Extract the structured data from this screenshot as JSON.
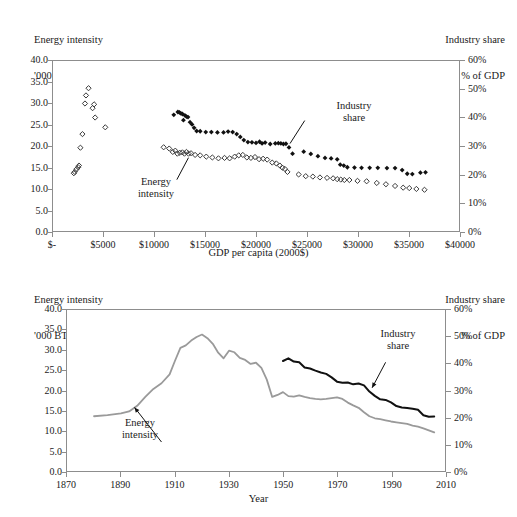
{
  "figure": {
    "panels": [
      {
        "id": "scatter-gdp",
        "left_axis_title_line1": "Energy intensity",
        "left_axis_title_line2": "'000 BTU/2000$",
        "right_axis_title_line1": "Industry share",
        "right_axis_title_line2": "% of GDP",
        "xlabel": "GDP per capita (2000$)",
        "yticks_left": [
          "40.0",
          "35.0",
          "30.0",
          "25.0",
          "20.0",
          "15.0",
          "10.0",
          "5.0",
          "0.0"
        ],
        "yticks_right": [
          "60%",
          "50%",
          "40%",
          "30%",
          "20%",
          "10%",
          "0%"
        ],
        "xticks": [
          "$-",
          "$5000",
          "$10000",
          "$15000",
          "$20000",
          "$25000",
          "$30000",
          "$35000",
          "$40000"
        ],
        "annotation_energy": "Energy\nintensity",
        "annotation_industry": "Industry\nshare"
      },
      {
        "id": "timeseries-year",
        "left_axis_title_line1": "Energy intensity",
        "left_axis_title_line2": "'000 BTU/2000$",
        "right_axis_title_line1": "Industry share",
        "right_axis_title_line2": "% of GDP",
        "xlabel": "Year",
        "yticks_left": [
          "40.0",
          "35.0",
          "30.0",
          "25.0",
          "20.0",
          "15.0",
          "10.0",
          "5.0",
          "0.0"
        ],
        "yticks_right": [
          "60%",
          "50%",
          "40%",
          "30%",
          "20%",
          "10%",
          "0%"
        ],
        "xticks": [
          "1870",
          "1890",
          "1910",
          "1930",
          "1950",
          "1970",
          "1990",
          "2010"
        ],
        "annotation_energy": "Energy\nintensity",
        "annotation_industry": "Industry\nshare"
      }
    ]
  },
  "chart_data": [
    {
      "type": "scatter",
      "id": "scatter-gdp",
      "title": "",
      "xlabel": "GDP per capita (2000$)",
      "ylabel": "Energy intensity '000 BTU/2000$",
      "y2label": "Industry share % of GDP",
      "xlim": [
        0,
        40000
      ],
      "ylim": [
        0.0,
        40.0
      ],
      "y2lim": [
        0,
        60
      ],
      "grid": false,
      "legend": "annotations",
      "xticks": [
        0,
        5000,
        10000,
        15000,
        20000,
        25000,
        30000,
        35000,
        40000
      ],
      "xticklabels": [
        "$-",
        "$5000",
        "$10000",
        "$15000",
        "$20000",
        "$25000",
        "$30000",
        "$35000",
        "$40000"
      ],
      "yticks": [
        0.0,
        5.0,
        10.0,
        15.0,
        20.0,
        25.0,
        30.0,
        35.0,
        40.0
      ],
      "y2ticks": [
        0,
        10,
        20,
        30,
        40,
        50,
        60
      ],
      "series": [
        {
          "name": "Energy intensity",
          "marker": "open-diamond",
          "color": "#3a3a3a",
          "axis": "left",
          "points": [
            [
              2050,
              13.6
            ],
            [
              2150,
              13.9
            ],
            [
              2300,
              14.5
            ],
            [
              2480,
              15.0
            ],
            [
              2560,
              15.4
            ],
            [
              2700,
              19.6
            ],
            [
              2900,
              22.8
            ],
            [
              3150,
              30.0
            ],
            [
              3250,
              31.9
            ],
            [
              3500,
              33.6
            ],
            [
              3900,
              28.9
            ],
            [
              4050,
              29.8
            ],
            [
              4150,
              26.7
            ],
            [
              5150,
              24.4
            ],
            [
              10900,
              19.7
            ],
            [
              11450,
              19.4
            ],
            [
              11800,
              18.6
            ],
            [
              12050,
              18.9
            ],
            [
              12250,
              18.2
            ],
            [
              12500,
              18.4
            ],
            [
              12750,
              18.5
            ],
            [
              12950,
              18.2
            ],
            [
              13150,
              18.6
            ],
            [
              13350,
              18.2
            ],
            [
              13600,
              18.3
            ],
            [
              14000,
              17.9
            ],
            [
              14500,
              17.8
            ],
            [
              15100,
              17.5
            ],
            [
              15700,
              17.3
            ],
            [
              16300,
              17.1
            ],
            [
              16900,
              17.2
            ],
            [
              17400,
              17.1
            ],
            [
              17900,
              17.5
            ],
            [
              18300,
              17.8
            ],
            [
              18700,
              17.9
            ],
            [
              19100,
              17.3
            ],
            [
              19500,
              17.2
            ],
            [
              19900,
              17.4
            ],
            [
              20300,
              16.9
            ],
            [
              20700,
              17.0
            ],
            [
              21100,
              16.8
            ],
            [
              21600,
              16.1
            ],
            [
              22000,
              15.9
            ],
            [
              22350,
              15.4
            ],
            [
              22600,
              14.9
            ],
            [
              22850,
              14.6
            ],
            [
              23100,
              13.9
            ],
            [
              24200,
              13.3
            ],
            [
              24900,
              12.9
            ],
            [
              25600,
              12.8
            ],
            [
              26300,
              12.6
            ],
            [
              27000,
              12.5
            ],
            [
              27600,
              12.4
            ],
            [
              28000,
              12.2
            ],
            [
              28350,
              12.1
            ],
            [
              28700,
              12.0
            ],
            [
              29200,
              12.0
            ],
            [
              30000,
              11.8
            ],
            [
              30900,
              11.7
            ],
            [
              31900,
              11.3
            ],
            [
              32800,
              11.0
            ],
            [
              33700,
              10.6
            ],
            [
              34500,
              10.2
            ],
            [
              35100,
              10.1
            ],
            [
              35800,
              9.9
            ],
            [
              36600,
              9.7
            ]
          ]
        },
        {
          "name": "Industry share",
          "marker": "solid-diamond",
          "color": "#111111",
          "axis": "right",
          "points": [
            [
              11900,
              41.0
            ],
            [
              12300,
              42.0
            ],
            [
              12450,
              41.9
            ],
            [
              12600,
              41.5
            ],
            [
              12750,
              41.3
            ],
            [
              12850,
              39.1
            ],
            [
              13000,
              40.8
            ],
            [
              13150,
              40.4
            ],
            [
              13300,
              40.2
            ],
            [
              13500,
              38.4
            ],
            [
              13700,
              37.6
            ],
            [
              13900,
              36.4
            ],
            [
              14150,
              35.3
            ],
            [
              14500,
              35.2
            ],
            [
              15050,
              34.9
            ],
            [
              15600,
              34.9
            ],
            [
              16200,
              34.8
            ],
            [
              16800,
              34.8
            ],
            [
              17250,
              35.1
            ],
            [
              17700,
              34.9
            ],
            [
              18100,
              34.2
            ],
            [
              18450,
              33.2
            ],
            [
              18800,
              32.1
            ],
            [
              19200,
              31.4
            ],
            [
              19600,
              31.3
            ],
            [
              20000,
              31.1
            ],
            [
              20350,
              31.5
            ],
            [
              20600,
              30.9
            ],
            [
              20900,
              31.2
            ],
            [
              21400,
              30.7
            ],
            [
              21900,
              30.9
            ],
            [
              22200,
              31.0
            ],
            [
              22450,
              30.9
            ],
            [
              22700,
              30.7
            ],
            [
              22950,
              30.8
            ],
            [
              23250,
              29.5
            ],
            [
              23600,
              27.3
            ],
            [
              24700,
              28.0
            ],
            [
              25400,
              27.2
            ],
            [
              26100,
              26.4
            ],
            [
              26800,
              25.8
            ],
            [
              27400,
              25.6
            ],
            [
              28000,
              25.3
            ],
            [
              28300,
              23.4
            ],
            [
              28650,
              23.1
            ],
            [
              29000,
              22.5
            ],
            [
              29700,
              22.4
            ],
            [
              30400,
              22.3
            ],
            [
              31200,
              22.3
            ],
            [
              32000,
              22.3
            ],
            [
              32900,
              22.2
            ],
            [
              33700,
              22.2
            ],
            [
              34400,
              21.5
            ],
            [
              34900,
              20.2
            ],
            [
              35400,
              20.1
            ],
            [
              36200,
              20.6
            ],
            [
              36700,
              20.7
            ]
          ]
        }
      ],
      "annotations": [
        {
          "text": "Energy intensity",
          "near_x": 13500,
          "near_y": 18.0
        },
        {
          "text": "Industry share",
          "near_x": 23300,
          "near_y": 30.0
        }
      ]
    },
    {
      "type": "line",
      "id": "timeseries-year",
      "title": "",
      "xlabel": "Year",
      "ylabel": "Energy intensity '000 BTU/2000$",
      "y2label": "Industry share % of GDP",
      "xlim": [
        1870,
        2010
      ],
      "ylim": [
        0.0,
        40.0
      ],
      "y2lim": [
        0,
        60
      ],
      "grid": false,
      "legend": "annotations",
      "xticks": [
        1870,
        1890,
        1910,
        1930,
        1950,
        1970,
        1990,
        2010
      ],
      "yticks": [
        0.0,
        5.0,
        10.0,
        15.0,
        20.0,
        25.0,
        30.0,
        35.0,
        40.0
      ],
      "y2ticks": [
        0,
        10,
        20,
        30,
        40,
        50,
        60
      ],
      "series": [
        {
          "name": "Energy intensity",
          "color": "#9a9a9a",
          "axis": "left",
          "x": [
            1880,
            1885,
            1890,
            1893,
            1896,
            1899,
            1902,
            1905,
            1908,
            1910,
            1912,
            1914,
            1916,
            1918,
            1920,
            1922,
            1924,
            1926,
            1928,
            1930,
            1932,
            1934,
            1936,
            1938,
            1940,
            1942,
            1944,
            1946,
            1948,
            1950,
            1952,
            1954,
            1956,
            1958,
            1960,
            1962,
            1964,
            1966,
            1968,
            1970,
            1972,
            1974,
            1976,
            1978,
            1980,
            1982,
            1984,
            1986,
            1988,
            1990,
            1992,
            1994,
            1996,
            1998,
            2000,
            2002,
            2004,
            2006
          ],
          "y": [
            13.6,
            13.9,
            14.3,
            14.8,
            16.2,
            18.4,
            20.4,
            21.8,
            24.0,
            27.4,
            30.6,
            31.2,
            32.4,
            33.3,
            33.9,
            33.0,
            31.6,
            29.4,
            28.0,
            29.9,
            29.5,
            28.1,
            27.6,
            26.6,
            26.9,
            25.6,
            22.7,
            18.4,
            18.9,
            19.6,
            18.6,
            18.5,
            18.8,
            18.4,
            18.1,
            17.9,
            17.8,
            17.9,
            18.1,
            18.3,
            17.9,
            17.0,
            16.3,
            15.7,
            14.6,
            13.6,
            13.1,
            12.9,
            12.6,
            12.3,
            12.1,
            11.9,
            11.7,
            11.3,
            11.0,
            10.6,
            10.1,
            9.6
          ]
        },
        {
          "name": "Industry share",
          "color": "#111111",
          "axis": "right",
          "x": [
            1950,
            1952,
            1954,
            1956,
            1958,
            1960,
            1962,
            1964,
            1966,
            1968,
            1970,
            1972,
            1974,
            1976,
            1978,
            1980,
            1982,
            1984,
            1986,
            1988,
            1990,
            1992,
            1994,
            1996,
            1998,
            2000,
            2002,
            2004,
            2006
          ],
          "y": [
            41.0,
            42.0,
            40.8,
            40.5,
            38.6,
            38.2,
            37.4,
            36.7,
            36.2,
            34.9,
            33.3,
            32.9,
            33.0,
            32.3,
            32.6,
            31.9,
            29.6,
            28.0,
            26.7,
            26.5,
            25.6,
            24.2,
            23.7,
            23.5,
            23.2,
            22.8,
            20.8,
            20.2,
            20.3
          ]
        }
      ],
      "annotations": [
        {
          "text": "Energy intensity",
          "near_x": 1895,
          "near_y": 15.5
        },
        {
          "text": "Industry share",
          "near_x": 1983,
          "near_y": 31.0
        }
      ]
    }
  ]
}
